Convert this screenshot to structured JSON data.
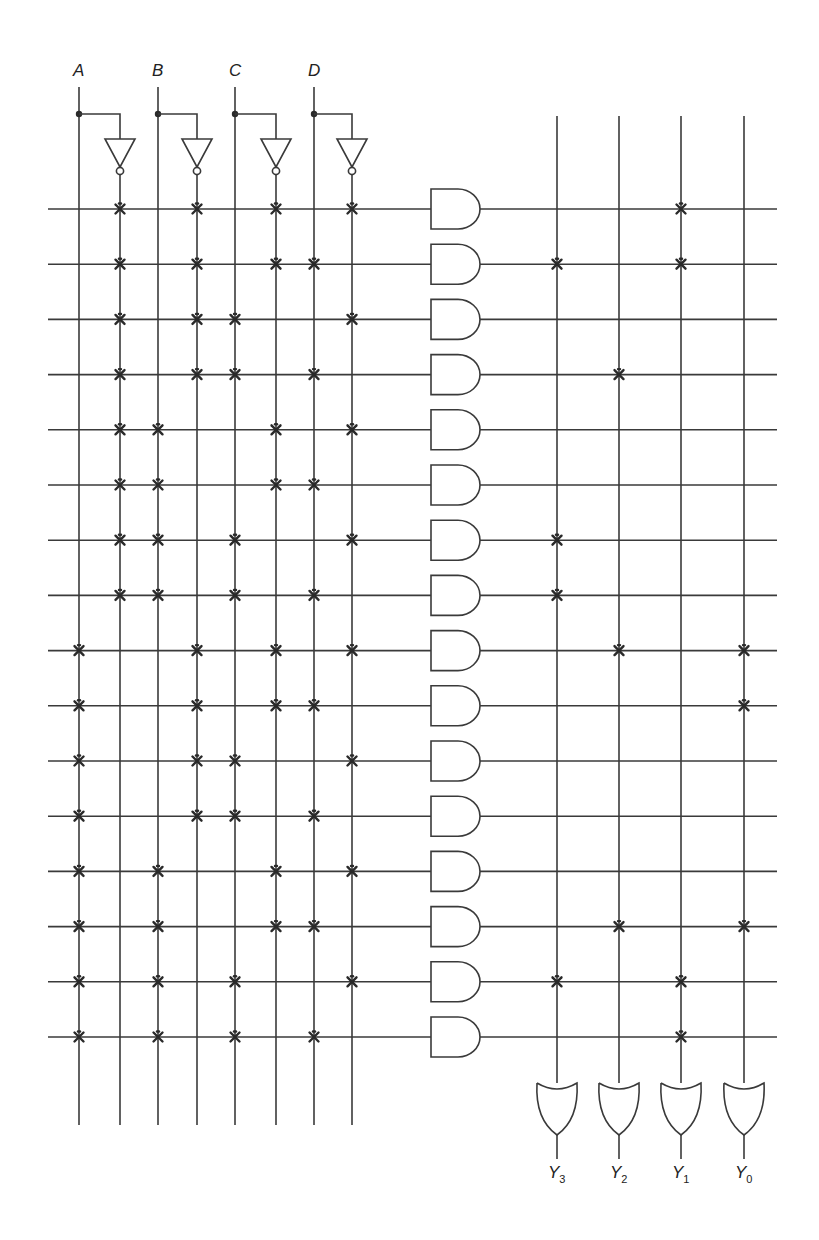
{
  "inputs": [
    {
      "label": "A",
      "true_x": 79,
      "comp_x": 120
    },
    {
      "label": "B",
      "true_x": 158,
      "comp_x": 197
    },
    {
      "label": "C",
      "true_x": 235,
      "comp_x": 276
    },
    {
      "label": "D",
      "true_x": 314,
      "comp_x": 352
    }
  ],
  "outputs": [
    {
      "label": "Y",
      "sub": "3",
      "x": 557,
      "minterm_rows": [
        1,
        6,
        7,
        14
      ]
    },
    {
      "label": "Y",
      "sub": "2",
      "x": 619,
      "minterm_rows": [
        3,
        8,
        13
      ]
    },
    {
      "label": "Y",
      "sub": "1",
      "x": 681,
      "minterm_rows": [
        0,
        1,
        14,
        15
      ]
    },
    {
      "label": "Y",
      "sub": "0",
      "x": 744,
      "minterm_rows": [
        8,
        9,
        13
      ]
    }
  ],
  "and_plane": {
    "row_count": 16,
    "first_row_y": 209,
    "row_spacing": 55.2,
    "line_order": [
      "A",
      "A'",
      "B",
      "B'",
      "C",
      "C'",
      "D",
      "D'"
    ],
    "rows": [
      {
        "minterm": 0,
        "term": "A'B'C'D'",
        "fuses": [
          "A'",
          "B'",
          "C'",
          "D'"
        ]
      },
      {
        "minterm": 1,
        "term": "A'B'C'D",
        "fuses": [
          "A'",
          "B'",
          "C'",
          "D"
        ]
      },
      {
        "minterm": 2,
        "term": "A'B'CD'",
        "fuses": [
          "A'",
          "B'",
          "C",
          "D'"
        ]
      },
      {
        "minterm": 3,
        "term": "A'B'CD",
        "fuses": [
          "A'",
          "B'",
          "C",
          "D"
        ]
      },
      {
        "minterm": 4,
        "term": "A'BC'D'",
        "fuses": [
          "A'",
          "B",
          "C'",
          "D'"
        ]
      },
      {
        "minterm": 5,
        "term": "A'BC'D",
        "fuses": [
          "A'",
          "B",
          "C'",
          "D"
        ]
      },
      {
        "minterm": 6,
        "term": "A'BCD'",
        "fuses": [
          "A'",
          "B",
          "C",
          "D'"
        ]
      },
      {
        "minterm": 7,
        "term": "A'BCD",
        "fuses": [
          "A'",
          "B",
          "C",
          "D"
        ]
      },
      {
        "minterm": 8,
        "term": "AB'C'D'",
        "fuses": [
          "A",
          "B'",
          "C'",
          "D'"
        ]
      },
      {
        "minterm": 9,
        "term": "AB'C'D",
        "fuses": [
          "A",
          "B'",
          "C'",
          "D"
        ]
      },
      {
        "minterm": 10,
        "term": "AB'CD'",
        "fuses": [
          "A",
          "B'",
          "C",
          "D'"
        ]
      },
      {
        "minterm": 11,
        "term": "AB'CD",
        "fuses": [
          "A",
          "B'",
          "C",
          "D"
        ]
      },
      {
        "minterm": 12,
        "term": "ABC'D'",
        "fuses": [
          "A",
          "B",
          "C'",
          "D'"
        ]
      },
      {
        "minterm": 13,
        "term": "ABC'D",
        "fuses": [
          "A",
          "B",
          "C'",
          "D"
        ]
      },
      {
        "minterm": 14,
        "term": "ABCD'",
        "fuses": [
          "A",
          "B",
          "C",
          "D'"
        ]
      },
      {
        "minterm": 15,
        "term": "ABCD",
        "fuses": [
          "A",
          "B",
          "C",
          "D"
        ]
      }
    ]
  },
  "colors": {
    "ink": "#3a3a3a",
    "fuse": "#2a2a2a",
    "background": "#ffffff"
  }
}
